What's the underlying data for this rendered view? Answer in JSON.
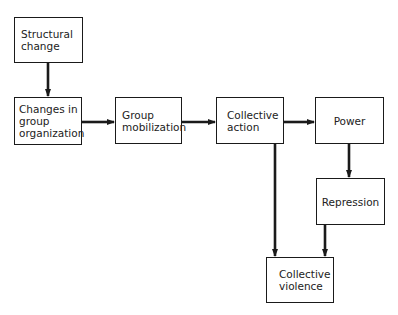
{
  "diagram": {
    "type": "flowchart",
    "nodes": [
      {
        "id": "structural",
        "label": "Structural\nchange"
      },
      {
        "id": "changes",
        "label": "Changes in\ngroup\norganization"
      },
      {
        "id": "mobilization",
        "label": "Group\nmobilization"
      },
      {
        "id": "action",
        "label": "Collective\naction"
      },
      {
        "id": "power",
        "label": "Power"
      },
      {
        "id": "repression",
        "label": "Repression"
      },
      {
        "id": "violence",
        "label": "Collective\nviolence"
      }
    ],
    "edges": [
      {
        "from": "structural",
        "to": "changes"
      },
      {
        "from": "changes",
        "to": "mobilization"
      },
      {
        "from": "mobilization",
        "to": "action"
      },
      {
        "from": "action",
        "to": "power"
      },
      {
        "from": "power",
        "to": "repression"
      },
      {
        "from": "action",
        "to": "violence"
      },
      {
        "from": "repression",
        "to": "violence"
      }
    ]
  }
}
